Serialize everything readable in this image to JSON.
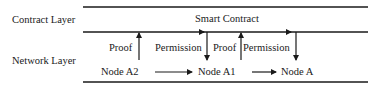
{
  "layers": {
    "contract": "Contract Layer",
    "network": "Network Layer"
  },
  "contract": {
    "title": "Smart Contract"
  },
  "edges": {
    "proof_1": "Proof",
    "permission_1": "Permission",
    "proof_2": "Proof",
    "permission_2": "Permission"
  },
  "nodes": {
    "a2": "Node A2",
    "a1": "Node A1",
    "a": "Node A"
  },
  "colors": {
    "line": "#1a1a1a",
    "background": "#ffffff"
  }
}
